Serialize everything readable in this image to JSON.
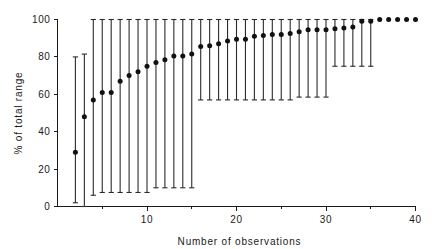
{
  "chart_data": {
    "type": "scatter",
    "title": "",
    "subtitle": "",
    "xlabel": "Number of observations",
    "ylabel": "% of total range",
    "xlim": [
      0,
      41
    ],
    "ylim": [
      0,
      104
    ],
    "grid": false,
    "legend": null,
    "x_ticks_major": [
      10,
      20,
      30,
      40
    ],
    "x_ticks_minor": [
      5,
      15,
      25,
      35
    ],
    "x_tick_labels": [
      "10",
      "20",
      "30",
      "40"
    ],
    "y_ticks_major": [
      0,
      20,
      40,
      60,
      80,
      100
    ],
    "y_tick_labels": [
      "0",
      "20",
      "40",
      "60",
      "80",
      "100"
    ],
    "marker": "filled-circle",
    "marker_color": "#111111",
    "errorbar_color": "#2b2b2b",
    "series": [
      {
        "name": "mean % of total range",
        "x": [
          2,
          3,
          4,
          5,
          6,
          7,
          8,
          9,
          10,
          11,
          12,
          13,
          14,
          15,
          16,
          17,
          18,
          19,
          20,
          21,
          22,
          23,
          24,
          25,
          26,
          27,
          28,
          29,
          30,
          31,
          32,
          33,
          34,
          35,
          36,
          37,
          38,
          39,
          40
        ],
        "values": [
          29,
          48,
          57,
          61,
          61,
          67,
          70,
          72,
          75,
          77,
          78.5,
          80.5,
          80.5,
          81.5,
          85.5,
          86,
          87,
          88.5,
          89.5,
          89.5,
          91,
          91.5,
          92,
          92,
          92.5,
          93.5,
          94.5,
          94.5,
          94.5,
          95,
          95.5,
          96,
          99,
          99,
          100,
          100,
          100,
          100,
          100
        ],
        "lower": [
          2,
          -1,
          6,
          7.5,
          7.5,
          7.5,
          7.5,
          7.5,
          7.5,
          10,
          10,
          10,
          10,
          10,
          57,
          57,
          57,
          57,
          57,
          57,
          57,
          57,
          57,
          57,
          57,
          58.5,
          58.5,
          58.5,
          58.5,
          75,
          75,
          75,
          75,
          75,
          null,
          null,
          null,
          null,
          null
        ],
        "upper": [
          80,
          81.5,
          100,
          100,
          100,
          100,
          100,
          100,
          100,
          100,
          100,
          100,
          100,
          100,
          100,
          100,
          100,
          100,
          100,
          100,
          100,
          100,
          100,
          100,
          100,
          100,
          100,
          100,
          100,
          100,
          100,
          100,
          100,
          100,
          null,
          null,
          null,
          null,
          null
        ]
      }
    ]
  },
  "figure": {
    "background_color": "#ffffff",
    "axis_color": "#1a1a1a"
  }
}
